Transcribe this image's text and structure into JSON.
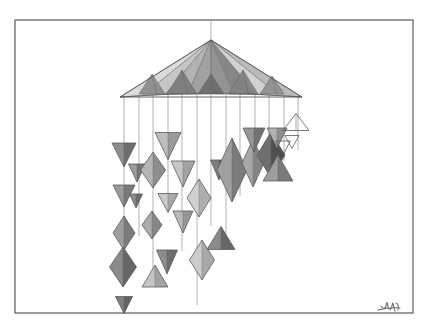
{
  "artwork": {
    "title": "Geometric Mobile",
    "medium": "graphite pencil drawing",
    "subject": "hanging mobile of tetrahedra, octahedra and triangular pendants suspended from a large faceted pyramid canopy",
    "background_color": "#ffffff",
    "paper_color": "#ffffff",
    "ink_color": "#4a4a4a",
    "signature_text": "artist-signature",
    "border": {
      "x": 15,
      "y": 20,
      "width": 398,
      "height": 293,
      "color": "#5a5a5a",
      "stroke_width": 1.2
    },
    "canopy": {
      "label": "pyramid-canopy",
      "apex_x": 211,
      "apex_y": 40,
      "base_left_x": 120,
      "base_right_x": 302,
      "base_y": 97,
      "hanger_string_top_y": 20,
      "facet_tones": [
        "#d9d9d9",
        "#c2c2c2",
        "#aeaeae",
        "#9a9a9a",
        "#8b8b8b",
        "#7d7d7d",
        "#cfcfcf",
        "#b6b6b6"
      ]
    },
    "strings": {
      "label": "hanging-strings",
      "color": "#8f8f8f",
      "stroke_width": 0.7,
      "count": 13,
      "x_positions": [
        124,
        139,
        153,
        168,
        182,
        197,
        211,
        226,
        240,
        255,
        269,
        284,
        298
      ],
      "bottom_y": [
        266,
        236,
        283,
        210,
        251,
        305,
        226,
        247,
        196,
        183,
        176,
        161,
        150
      ]
    },
    "pendants": [
      {
        "name": "pendant-tri-01",
        "type": "triangle-down",
        "cx": 124,
        "cy": 155,
        "w": 24,
        "h": 24,
        "tone_l": "#8e8e8e",
        "tone_r": "#6f6f6f"
      },
      {
        "name": "pendant-tri-02",
        "type": "triangle-down",
        "cx": 124,
        "cy": 196,
        "w": 22,
        "h": 22,
        "tone_l": "#9a9a9a",
        "tone_r": "#7a7a7a"
      },
      {
        "name": "pendant-diamond-03",
        "type": "diamond",
        "cx": 124,
        "cy": 233,
        "w": 22,
        "h": 34,
        "tone_l": "#9e9e9e",
        "tone_r": "#7c7c7c"
      },
      {
        "name": "pendant-diamond-04",
        "type": "diamond",
        "cx": 123,
        "cy": 267,
        "w": 27,
        "h": 40,
        "tone_l": "#8a8a8a",
        "tone_r": "#666666"
      },
      {
        "name": "pendant-tri-05",
        "type": "triangle-down",
        "cx": 124,
        "cy": 305,
        "w": 17,
        "h": 17,
        "tone_l": "#7f7f7f",
        "tone_r": "#636363"
      },
      {
        "name": "pendant-tri-06",
        "type": "triangle-down",
        "cx": 137,
        "cy": 173,
        "w": 17,
        "h": 18,
        "tone_l": "#9c9c9c",
        "tone_r": "#757575"
      },
      {
        "name": "pendant-tri-07",
        "type": "triangle-down",
        "cx": 136,
        "cy": 201,
        "w": 13,
        "h": 14,
        "tone_l": "#8b8b8b",
        "tone_r": "#6b6b6b"
      },
      {
        "name": "pendant-diamond-08",
        "type": "diamond",
        "cx": 153,
        "cy": 170,
        "w": 25,
        "h": 36,
        "tone_l": "#b4b4b4",
        "tone_r": "#8f8f8f"
      },
      {
        "name": "pendant-diamond-09",
        "type": "diamond",
        "cx": 152,
        "cy": 225,
        "w": 20,
        "h": 28,
        "tone_l": "#ababab",
        "tone_r": "#878787"
      },
      {
        "name": "pendant-tri-10",
        "type": "triangle-down",
        "cx": 167,
        "cy": 262,
        "w": 21,
        "h": 24,
        "tone_l": "#8c8c8c",
        "tone_r": "#6d6d6d"
      },
      {
        "name": "pendant-tri-11",
        "type": "triangle-up",
        "cx": 155,
        "cy": 276,
        "w": 26,
        "h": 22,
        "tone_l": "#c4c4c4",
        "tone_r": "#a4a4a4"
      },
      {
        "name": "pendant-tri-12",
        "type": "triangle-down",
        "cx": 168,
        "cy": 146,
        "w": 26,
        "h": 27,
        "tone_l": "#bdbdbd",
        "tone_r": "#9a9a9a"
      },
      {
        "name": "pendant-tri-13",
        "type": "triangle-down",
        "cx": 168,
        "cy": 203,
        "w": 20,
        "h": 19,
        "tone_l": "#c9c9c9",
        "tone_r": "#a8a8a8"
      },
      {
        "name": "pendant-tri-14",
        "type": "triangle-down",
        "cx": 183,
        "cy": 174,
        "w": 24,
        "h": 26,
        "tone_l": "#c6c6c6",
        "tone_r": "#a2a2a2"
      },
      {
        "name": "pendant-tri-15",
        "type": "triangle-down",
        "cx": 183,
        "cy": 222,
        "w": 20,
        "h": 22,
        "tone_l": "#b9b9b9",
        "tone_r": "#969696"
      },
      {
        "name": "pendant-diamond-16",
        "type": "diamond",
        "cx": 199,
        "cy": 198,
        "w": 24,
        "h": 38,
        "tone_l": "#d0d0d0",
        "tone_r": "#aeaeae"
      },
      {
        "name": "pendant-diamond-17",
        "type": "diamond",
        "cx": 202,
        "cy": 260,
        "w": 25,
        "h": 40,
        "tone_l": "#cccccc",
        "tone_r": "#a9a9a9"
      },
      {
        "name": "pendant-tri-18",
        "type": "triangle-down",
        "cx": 219,
        "cy": 170,
        "w": 17,
        "h": 20,
        "tone_l": "#7e7e7e",
        "tone_r": "#5f5f5f"
      },
      {
        "name": "pendant-diamond-19",
        "type": "diamond",
        "cx": 232,
        "cy": 170,
        "w": 30,
        "h": 64,
        "tone_l": "#a0a0a0",
        "tone_r": "#7b7b7b"
      },
      {
        "name": "pendant-tri-20",
        "type": "triangle-up",
        "cx": 221,
        "cy": 238,
        "w": 28,
        "h": 23,
        "tone_l": "#8b8b8b",
        "tone_r": "#676767"
      },
      {
        "name": "pendant-diamond-21",
        "type": "diamond",
        "cx": 253,
        "cy": 163,
        "w": 22,
        "h": 48,
        "tone_l": "#a7a7a7",
        "tone_r": "#848484"
      },
      {
        "name": "pendant-tri-22",
        "type": "triangle-down",
        "cx": 254,
        "cy": 140,
        "w": 22,
        "h": 24,
        "tone_l": "#959595",
        "tone_r": "#727272"
      },
      {
        "name": "pendant-diamond-23",
        "type": "diamond",
        "cx": 271,
        "cy": 155,
        "w": 28,
        "h": 46,
        "tone_l": "#6e6e6e",
        "tone_r": "#4f4f4f"
      },
      {
        "name": "pendant-tri-24",
        "type": "triangle-up",
        "cx": 278,
        "cy": 168,
        "w": 30,
        "h": 26,
        "tone_l": "#9d9d9d",
        "tone_r": "#7a7a7a"
      },
      {
        "name": "pendant-tri-25",
        "type": "triangle-down",
        "cx": 277,
        "cy": 138,
        "w": 20,
        "h": 20,
        "tone_l": "#b1b1b1",
        "tone_r": "#8e8e8e"
      },
      {
        "name": "pendant-outline-26",
        "type": "triangle-up-outline",
        "cx": 296,
        "cy": 122,
        "w": 26,
        "h": 17
      },
      {
        "name": "pendant-outline-27",
        "type": "triangle-down-outline",
        "cx": 292,
        "cy": 142,
        "w": 14,
        "h": 13
      },
      {
        "name": "pendant-outline-28",
        "type": "triangle-down-outline",
        "cx": 283,
        "cy": 148,
        "w": 15,
        "h": 14
      }
    ],
    "legend": {
      "shaded_label": "shaded graphite pendant",
      "outline_label": "unshaded outline pendant"
    }
  }
}
